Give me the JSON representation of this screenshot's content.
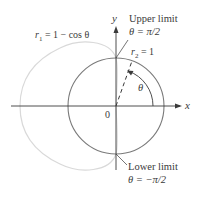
{
  "axes": {
    "x_label": "x",
    "y_label": "y",
    "origin_label": "0"
  },
  "curves": {
    "r1": {
      "label": "r",
      "subscript": "1",
      "equation_rest": " = 1 − cos θ",
      "color": "#d9d9d9"
    },
    "r2": {
      "label": "r",
      "subscript": "2",
      "equation_rest": " = 1",
      "color": "#7a7a7a"
    }
  },
  "annotations": {
    "upper_limit": {
      "title": "Upper limit",
      "value": "θ = π/2"
    },
    "lower_limit": {
      "title": "Lower limit",
      "value": "θ = −π/2"
    },
    "angle_label": "θ"
  },
  "colors": {
    "axis": "#3a3a3a",
    "text": "#3a3a3a"
  }
}
